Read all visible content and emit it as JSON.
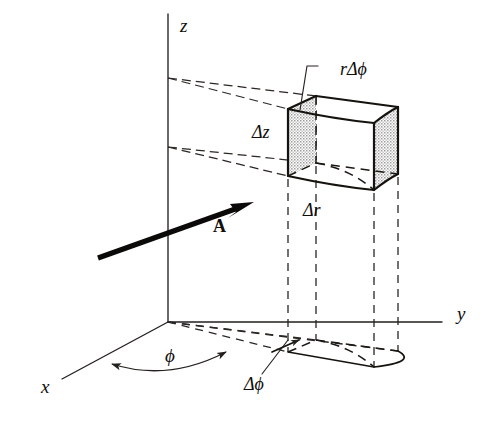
{
  "figure": {
    "background_color": "#ffffff",
    "ink_color": "#16130f",
    "stipple_color": "#b9b9b9",
    "width": 502,
    "height": 421
  },
  "axes": [
    {
      "name": "z-axis",
      "label": "z",
      "label_x": 180,
      "label_y": 28,
      "x1": 168,
      "y1": 14,
      "x2": 168,
      "y2": 322
    },
    {
      "name": "y-axis",
      "label": "y",
      "label_x": 457,
      "label_y": 316,
      "x1": 168,
      "y1": 322,
      "x2": 442,
      "y2": 322
    },
    {
      "name": "x-axis",
      "label": "x",
      "label_x": 41,
      "label_y": 389,
      "x1": 168,
      "y1": 322,
      "x2": 62,
      "y2": 379
    }
  ],
  "labels": {
    "z_axis": "z",
    "y_axis": "y",
    "x_axis": "x",
    "vector": "A",
    "arc_r_dphi": "rΔϕ",
    "height_dz": "Δz",
    "radial_dr": "Δr",
    "angle_phi": "ϕ",
    "angle_dphi": "Δϕ"
  },
  "label_positions": {
    "arc_r_dphi": {
      "x": 340,
      "y": 71
    },
    "height_dz": {
      "x": 252,
      "y": 134
    },
    "radial_dr": {
      "x": 303,
      "y": 212
    },
    "angle_phi": {
      "x": 165,
      "y": 358
    },
    "angle_dphi": {
      "x": 244,
      "y": 386
    },
    "vector": {
      "x": 213,
      "y": 228
    }
  },
  "volume_element": {
    "description": "Differential volume element in cylindrical coordinates with dimensions dr, r dphi, dz",
    "faces_shaded": [
      "inner-r-face",
      "outer-r-face"
    ],
    "vertices": {
      "top_near_left": {
        "x": 288,
        "y": 109
      },
      "top_far_left": {
        "x": 316,
        "y": 96
      },
      "top_far_right": {
        "x": 398,
        "y": 107
      },
      "top_near_right": {
        "x": 374,
        "y": 123
      },
      "bot_near_left": {
        "x": 288,
        "y": 176
      },
      "bot_far_left": {
        "x": 316,
        "y": 163
      },
      "bot_far_right": {
        "x": 398,
        "y": 174
      },
      "bot_near_right": {
        "x": 374,
        "y": 190
      }
    }
  },
  "base_projection": {
    "description": "Projection of the volume element onto the x-y plane",
    "vertices": {
      "near_left": {
        "x": 288,
        "y": 352
      },
      "far_left": {
        "x": 316,
        "y": 340
      },
      "far_right": {
        "x": 398,
        "y": 351
      },
      "near_right": {
        "x": 374,
        "y": 367
      }
    }
  },
  "perspective_rays": {
    "upper_origin": {
      "x": 168,
      "y": 78
    },
    "lower_origin": {
      "x": 168,
      "y": 147
    },
    "count": 4
  },
  "vector_arrow": {
    "label": "A",
    "bold": true,
    "start": {
      "x": 98,
      "y": 258
    },
    "end": {
      "x": 252,
      "y": 203
    }
  },
  "arc_arrow_phi": {
    "double_headed": true,
    "from": {
      "x": 112,
      "y": 364
    },
    "to": {
      "x": 226,
      "y": 352
    }
  }
}
